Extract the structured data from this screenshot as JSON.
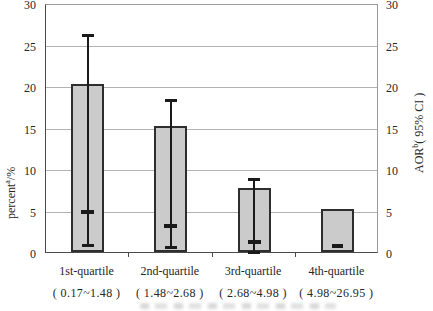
{
  "axes": {
    "ticks": [
      "0",
      "5",
      "10",
      "15",
      "20",
      "25",
      "30"
    ],
    "left": {
      "title_main": "percent",
      "title_sup": "a",
      "title_rest": "/%"
    },
    "right": {
      "title_main": "AOR",
      "title_sup": "b",
      "title_rest": "( 95% CI )"
    }
  },
  "chart_data": {
    "type": "bar",
    "title": "",
    "categories": [
      "1st-quartile",
      "2nd-quartile",
      "3rd-quartile",
      "4th-quartile"
    ],
    "category_ranges": [
      "( 0.17~1.48 )",
      "( 1.48~2.68 )",
      "( 2.68~4.98 )",
      "( 4.98~26.95 )"
    ],
    "ylabel_left": "percent(a)/%",
    "ylabel_right": "AOR(b)( 95% CI )",
    "ylim": [
      0,
      30
    ],
    "tick_interval": 5,
    "grid": true,
    "legend": "none",
    "series": [
      {
        "name": "percent",
        "axis": "left",
        "kind": "bar",
        "values": [
          20.3,
          15.2,
          7.7,
          5.2
        ]
      },
      {
        "name": "AOR ( 95% CI )",
        "axis": "right",
        "kind": "errorbar",
        "point": [
          5.1,
          3.4,
          1.4,
          1.0
        ],
        "ci_low": [
          1.1,
          0.9,
          0.3,
          null
        ],
        "ci_high": [
          26.4,
          18.6,
          9.0,
          null
        ]
      }
    ],
    "colors": {
      "bar_fill": "#cbcbcb",
      "bar_border": "#2e2e2e",
      "errorbar": "#1a1a1a",
      "gridline": "#b2b2b2"
    }
  }
}
